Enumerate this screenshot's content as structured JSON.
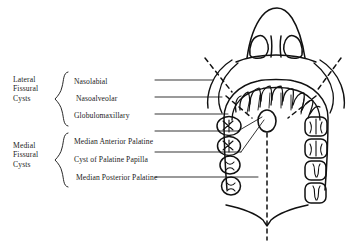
{
  "figure": {
    "view_description": "Frontal/palatal composite view of the maxilla showing nose, maxillary arch, teeth and midline",
    "ink_color": "#111111",
    "background_color": "#ffffff"
  },
  "groups": [
    {
      "id": "lateral",
      "label": "Lateral\nFissural\nCysts",
      "label_lines": [
        "Lateral",
        "Fissural",
        "Cysts"
      ],
      "items": [
        {
          "id": "nasolabial",
          "label": "Nasolabial"
        },
        {
          "id": "nasoalveolar",
          "label": "Nasoalveolar"
        },
        {
          "id": "globulomaxillary",
          "label": "Globulomaxillary"
        }
      ]
    },
    {
      "id": "medial",
      "label": "Medial\nFissural\nCysts",
      "label_lines": [
        "Medial",
        "Fissural",
        "Cysts"
      ],
      "items": [
        {
          "id": "median-anterior-palatine",
          "label": "Median Anterior Palatine"
        },
        {
          "id": "cyst-of-palatine-papilla",
          "label": "Cyst of Palatine Papilla"
        },
        {
          "id": "median-posterior-palatine",
          "label": "Median Posterior Palatine"
        }
      ]
    }
  ],
  "anatomy": {
    "midline": "dashed vertical midline",
    "papilla": "incisive papilla oval",
    "teeth_left_count": 4,
    "teeth_right_count": 4,
    "anterior_teeth_count": 10,
    "soft_palate": "posterior palate border with central notch"
  }
}
